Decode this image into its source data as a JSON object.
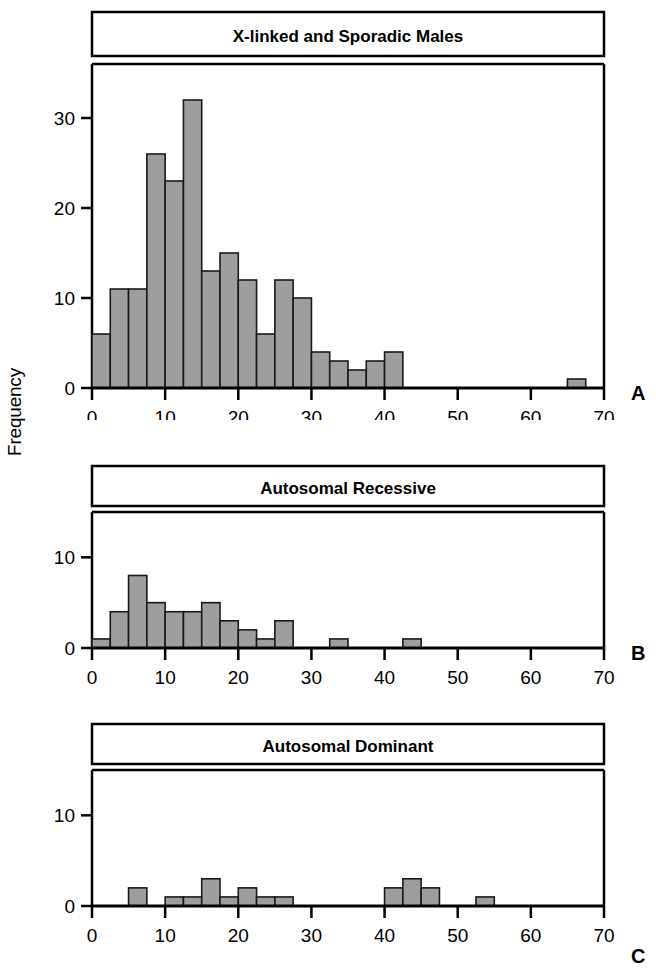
{
  "figure": {
    "axis_title_y": "Frequency",
    "axis_title_x": "Age (Years)",
    "bar_fill": "#9e9e9e",
    "bar_stroke": "#1a1a1a",
    "frame_color": "#000000"
  },
  "panels": [
    {
      "letter": "A",
      "title": "X-linked and Sporadic Males",
      "y_ticks": [
        "0",
        "10",
        "20",
        "30"
      ],
      "x_ticks": [
        "0",
        "10",
        "20",
        "30",
        "40",
        "50",
        "60",
        "70"
      ]
    },
    {
      "letter": "B",
      "title": "Autosomal Recessive",
      "y_ticks": [
        "0",
        "10"
      ],
      "x_ticks": [
        "0",
        "10",
        "20",
        "30",
        "40",
        "50",
        "60",
        "70"
      ]
    },
    {
      "letter": "C",
      "title": "Autosomal Dominant",
      "y_ticks": [
        "0",
        "10"
      ],
      "x_ticks": [
        "0",
        "10",
        "20",
        "30",
        "40",
        "50",
        "60",
        "70"
      ]
    }
  ],
  "chart_data": [
    {
      "type": "bar",
      "title": "X-linked and Sporadic Males",
      "panel": "A",
      "xlabel": "Age (Years)",
      "ylabel": "Frequency",
      "xlim": [
        0,
        70
      ],
      "ylim": [
        0,
        36
      ],
      "bin_width": 2.5,
      "grid": false,
      "legend": false,
      "y_ticks": [
        0,
        10,
        20,
        30
      ],
      "x_ticks": [
        0,
        10,
        20,
        30,
        40,
        50,
        60,
        70
      ],
      "bins": [
        {
          "x0": 0.0,
          "x1": 2.5,
          "value": 6
        },
        {
          "x0": 2.5,
          "x1": 5.0,
          "value": 11
        },
        {
          "x0": 5.0,
          "x1": 7.5,
          "value": 11
        },
        {
          "x0": 7.5,
          "x1": 10.0,
          "value": 26
        },
        {
          "x0": 10.0,
          "x1": 12.5,
          "value": 23
        },
        {
          "x0": 12.5,
          "x1": 15.0,
          "value": 32
        },
        {
          "x0": 15.0,
          "x1": 17.5,
          "value": 13
        },
        {
          "x0": 17.5,
          "x1": 20.0,
          "value": 15
        },
        {
          "x0": 20.0,
          "x1": 22.5,
          "value": 12
        },
        {
          "x0": 22.5,
          "x1": 25.0,
          "value": 6
        },
        {
          "x0": 25.0,
          "x1": 27.5,
          "value": 12
        },
        {
          "x0": 27.5,
          "x1": 30.0,
          "value": 10
        },
        {
          "x0": 30.0,
          "x1": 32.5,
          "value": 4
        },
        {
          "x0": 32.5,
          "x1": 35.0,
          "value": 3
        },
        {
          "x0": 35.0,
          "x1": 37.5,
          "value": 2
        },
        {
          "x0": 37.5,
          "x1": 40.0,
          "value": 3
        },
        {
          "x0": 40.0,
          "x1": 42.5,
          "value": 4
        },
        {
          "x0": 65.0,
          "x1": 67.5,
          "value": 1
        }
      ]
    },
    {
      "type": "bar",
      "title": "Autosomal Recessive",
      "panel": "B",
      "xlabel": "Age (Years)",
      "ylabel": "Frequency",
      "xlim": [
        0,
        70
      ],
      "ylim": [
        0,
        15
      ],
      "bin_width": 2.5,
      "grid": false,
      "legend": false,
      "y_ticks": [
        0,
        10
      ],
      "x_ticks": [
        0,
        10,
        20,
        30,
        40,
        50,
        60,
        70
      ],
      "bins": [
        {
          "x0": 0.0,
          "x1": 2.5,
          "value": 1
        },
        {
          "x0": 2.5,
          "x1": 5.0,
          "value": 4
        },
        {
          "x0": 5.0,
          "x1": 7.5,
          "value": 8
        },
        {
          "x0": 7.5,
          "x1": 10.0,
          "value": 5
        },
        {
          "x0": 10.0,
          "x1": 12.5,
          "value": 4
        },
        {
          "x0": 12.5,
          "x1": 15.0,
          "value": 4
        },
        {
          "x0": 15.0,
          "x1": 17.5,
          "value": 5
        },
        {
          "x0": 17.5,
          "x1": 20.0,
          "value": 3
        },
        {
          "x0": 20.0,
          "x1": 22.5,
          "value": 2
        },
        {
          "x0": 22.5,
          "x1": 25.0,
          "value": 1
        },
        {
          "x0": 25.0,
          "x1": 27.5,
          "value": 3
        },
        {
          "x0": 32.5,
          "x1": 35.0,
          "value": 1
        },
        {
          "x0": 42.5,
          "x1": 45.0,
          "value": 1
        }
      ]
    },
    {
      "type": "bar",
      "title": "Autosomal Dominant",
      "panel": "C",
      "xlabel": "Age (Years)",
      "ylabel": "Frequency",
      "xlim": [
        0,
        70
      ],
      "ylim": [
        0,
        15
      ],
      "bin_width": 2.5,
      "grid": false,
      "legend": false,
      "y_ticks": [
        0,
        10
      ],
      "x_ticks": [
        0,
        10,
        20,
        30,
        40,
        50,
        60,
        70
      ],
      "bins": [
        {
          "x0": 5.0,
          "x1": 7.5,
          "value": 2
        },
        {
          "x0": 10.0,
          "x1": 12.5,
          "value": 1
        },
        {
          "x0": 12.5,
          "x1": 15.0,
          "value": 1
        },
        {
          "x0": 15.0,
          "x1": 17.5,
          "value": 3
        },
        {
          "x0": 17.5,
          "x1": 20.0,
          "value": 1
        },
        {
          "x0": 20.0,
          "x1": 22.5,
          "value": 2
        },
        {
          "x0": 22.5,
          "x1": 25.0,
          "value": 1
        },
        {
          "x0": 25.0,
          "x1": 27.5,
          "value": 1
        },
        {
          "x0": 40.0,
          "x1": 42.5,
          "value": 2
        },
        {
          "x0": 42.5,
          "x1": 45.0,
          "value": 3
        },
        {
          "x0": 45.0,
          "x1": 47.5,
          "value": 2
        },
        {
          "x0": 52.5,
          "x1": 55.0,
          "value": 1
        }
      ]
    }
  ]
}
